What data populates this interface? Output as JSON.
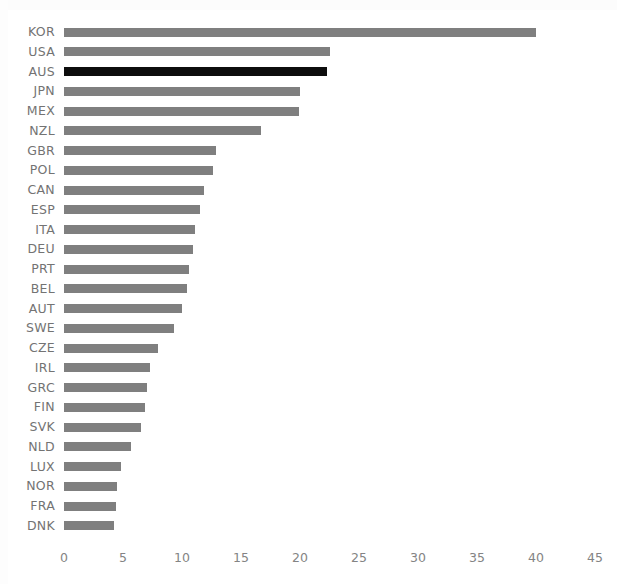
{
  "chart_data": {
    "type": "bar",
    "orientation": "horizontal",
    "title": "",
    "subtitle": "",
    "xlabel": "",
    "ylabel": "",
    "xlim": [
      0,
      45
    ],
    "xticks": [
      0,
      5,
      10,
      15,
      20,
      25,
      30,
      35,
      40,
      45
    ],
    "xtick_labels": [
      "0",
      "5",
      "10",
      "15",
      "20",
      "25",
      "30",
      "35",
      "40",
      "45"
    ],
    "grid": false,
    "legend": null,
    "categories": [
      "KOR",
      "USA",
      "AUS",
      "JPN",
      "MEX",
      "NZL",
      "GBR",
      "POL",
      "CAN",
      "ESP",
      "ITA",
      "DEU",
      "PRT",
      "BEL",
      "AUT",
      "SWE",
      "CZE",
      "IRL",
      "GRC",
      "FIN",
      "SVK",
      "NLD",
      "LUX",
      "NOR",
      "FRA",
      "DNK"
    ],
    "values": [
      40.0,
      22.5,
      22.3,
      20.0,
      19.9,
      16.7,
      12.9,
      12.6,
      11.9,
      11.5,
      11.1,
      10.9,
      10.6,
      10.4,
      10.0,
      9.3,
      8.0,
      7.3,
      7.0,
      6.9,
      6.5,
      5.7,
      4.8,
      4.5,
      4.4,
      4.2
    ],
    "highlighted_category": "AUS",
    "bar_color": "#7f7f7f",
    "highlight_color": "#0d0d0d",
    "label_color": "#737373",
    "tick_color": "#848484",
    "background_color": "#ffffff"
  }
}
